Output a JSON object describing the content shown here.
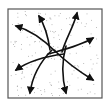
{
  "diagram": {
    "title": "",
    "box": {
      "x": 8,
      "y": 9,
      "width": 94,
      "height": 89,
      "stroke": "#555555",
      "fill": "#ffffff"
    },
    "stipple_color": "#9a9a9a",
    "arrow_color": "#111111",
    "arrows": [
      {
        "name": "arrow-up-left",
        "path": "M56 52 C 42 38, 30 30, 16 26",
        "tip": [
          16,
          26
        ],
        "angle": 200
      },
      {
        "name": "arrow-up",
        "path": "M50 50 C 48 36, 44 24, 39 16",
        "tip": [
          39,
          16
        ],
        "angle": 245
      },
      {
        "name": "arrow-up-right",
        "path": "M62 52 C 66 38, 74 26, 77 13",
        "tip": [
          77,
          13
        ],
        "angle": 285
      },
      {
        "name": "arrow-right",
        "path": "M48 54 C 62 50, 80 46, 93 38",
        "tip": [
          93,
          38
        ],
        "angle": 330
      },
      {
        "name": "arrow-down-right",
        "path": "M54 50 C 66 62, 80 72, 93 80",
        "tip": [
          93,
          80
        ],
        "angle": 30
      },
      {
        "name": "arrow-down",
        "path": "M66 46 C 62 60, 62 78, 66 93",
        "tip": [
          66,
          93
        ],
        "angle": 78
      },
      {
        "name": "arrow-down-left",
        "path": "M52 50 C 40 62, 32 78, 30 93",
        "tip": [
          30,
          93
        ],
        "angle": 96
      },
      {
        "name": "arrow-left",
        "path": "M64 54 C 48 56, 30 60, 16 70",
        "tip": [
          16,
          70
        ],
        "angle": 148
      }
    ]
  }
}
